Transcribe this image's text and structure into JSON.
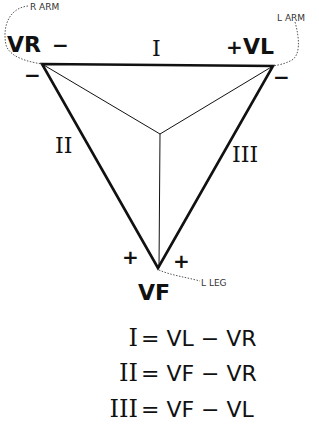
{
  "diagram": {
    "electrodes": {
      "right_arm": {
        "lead": "VR",
        "label": "R ARM"
      },
      "left_arm": {
        "lead": "VL",
        "label": "L ARM"
      },
      "left_leg": {
        "lead": "VF",
        "label": "L LEG"
      }
    },
    "leads": {
      "I": "I",
      "II": "II",
      "III": "III"
    },
    "polarity": {
      "vr_top": "−",
      "vr_bottom": "−",
      "vl_top": "+",
      "vl_bottom": "−",
      "vf_left": "+",
      "vf_right": "+"
    },
    "equations": [
      {
        "lead": "I",
        "expr": "= VL − VR"
      },
      {
        "lead": "II",
        "expr": "= VF − VR"
      },
      {
        "lead": "III",
        "expr": "= VF − VL"
      }
    ],
    "colors": {
      "ink": "#111111",
      "dotted": "#555555"
    }
  }
}
